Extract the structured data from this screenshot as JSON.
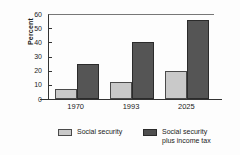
{
  "chart_data": {
    "type": "bar",
    "title": "",
    "subtitle": "",
    "xlabel": "",
    "ylabel": "Percent",
    "categories": [
      "1970",
      "1993",
      "2025"
    ],
    "series": [
      {
        "name": "Social security",
        "color": "#c9c9c9",
        "values": [
          7,
          12,
          20
        ]
      },
      {
        "name": "Social security\nplus income tax",
        "color": "#555555",
        "values": [
          25,
          40,
          56
        ]
      }
    ],
    "ylim": [
      0,
      60
    ],
    "yticks": [
      0,
      10,
      20,
      30,
      40,
      50,
      60
    ],
    "ytick_labels": [
      "0",
      "10",
      "20",
      "30",
      "40",
      "50",
      "60"
    ],
    "grid": false,
    "legend_position": "bottom",
    "annotations": []
  },
  "legend": {
    "entries": [
      {
        "label": "Social security"
      },
      {
        "label": "Social security\nplus income tax"
      }
    ]
  }
}
